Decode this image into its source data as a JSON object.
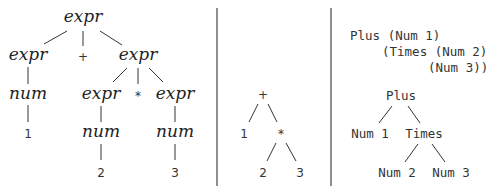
{
  "panels": {
    "parse_tree": {
      "root": "expr",
      "level1": [
        "expr",
        "+",
        "expr"
      ],
      "left_num": "num",
      "left_leaf": "1",
      "level2": [
        "expr",
        "*",
        "expr"
      ],
      "level2_nums": [
        "num",
        "num"
      ],
      "level2_leaves": [
        "2",
        "3"
      ]
    },
    "syntax_tree": {
      "root": "+",
      "left": "1",
      "op": "*",
      "leaves": [
        "2",
        "3"
      ]
    },
    "haskell_ast": {
      "code_lines": [
        "Plus (Num 1)",
        "(Times (Num 2)",
        "(Num 3))"
      ],
      "tree_root": "Plus",
      "tree_left": "Num 1",
      "tree_right": "Times",
      "tree_leaves": [
        "Num 2",
        "Num 3"
      ]
    }
  }
}
